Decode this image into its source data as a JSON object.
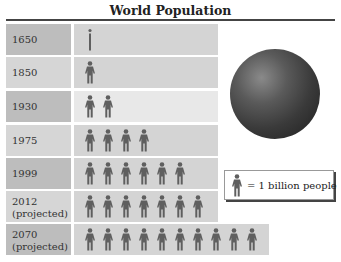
{
  "chart_data": {
    "type": "pictograph",
    "title": "World Population",
    "unit": "1 billion people per figure",
    "categories": [
      "1650",
      "1850",
      "1930",
      "1975",
      "1999",
      "2012 (projected)",
      "2070 (projected)"
    ],
    "values": [
      0.5,
      1,
      2,
      4,
      6,
      7,
      10
    ],
    "legend": "= 1 billion people"
  },
  "title": "World Population",
  "rows": [
    {
      "label_line1": "1650",
      "label_line2": "",
      "count": 0.5
    },
    {
      "label_line1": "1850",
      "label_line2": "",
      "count": 1
    },
    {
      "label_line1": "1930",
      "label_line2": "",
      "count": 2
    },
    {
      "label_line1": "1975",
      "label_line2": "",
      "count": 4
    },
    {
      "label_line1": "1999",
      "label_line2": "",
      "count": 6
    },
    {
      "label_line1": "2012",
      "label_line2": "(projected)",
      "count": 7
    },
    {
      "label_line1": "2070",
      "label_line2": "(projected)",
      "count": 10
    }
  ],
  "legend": {
    "text": "= 1 billion people",
    "icon": "person-icon"
  },
  "colors": {
    "figure": "#5f5f5f",
    "dark_label": "#bdbdbd",
    "light_label": "#d6d6d6",
    "globe": "#3a3a3a"
  }
}
